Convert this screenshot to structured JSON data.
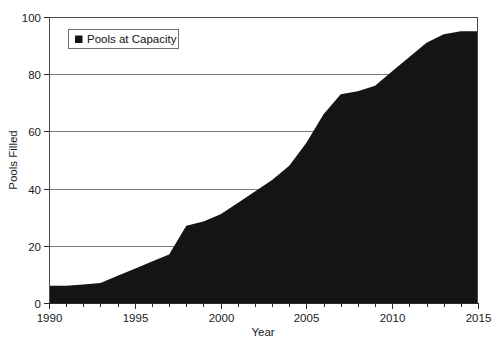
{
  "chart_data": {
    "type": "area",
    "title": "",
    "xlabel": "Year",
    "ylabel": "Pools Filled",
    "xlim": [
      1990,
      2015
    ],
    "ylim": [
      0,
      100
    ],
    "grid": true,
    "grid_axis": "y",
    "legend_position": "top-left",
    "legend": [
      "Pools at Capacity"
    ],
    "series_color": "#141414",
    "xticks": [
      1990,
      1995,
      2000,
      2005,
      2010,
      2015
    ],
    "xtick_labels": [
      "1990",
      "1995",
      "2000",
      "2005",
      "2010",
      "2015"
    ],
    "xminor_step": 1,
    "yticks": [
      0,
      20,
      40,
      60,
      80,
      100
    ],
    "ytick_labels": [
      "0",
      "20",
      "40",
      "60",
      "80",
      "100"
    ],
    "x": [
      1990,
      1991,
      1992,
      1993,
      1994,
      1995,
      1996,
      1997,
      1998,
      1999,
      2000,
      2001,
      2002,
      2003,
      2004,
      2005,
      2006,
      2007,
      2008,
      2009,
      2010,
      2011,
      2012,
      2013,
      2014,
      2015
    ],
    "series": [
      {
        "name": "Pools at Capacity",
        "values": [
          6,
          6,
          6.5,
          7,
          9.5,
          12,
          14.5,
          17,
          27,
          28.5,
          31,
          35,
          39,
          43,
          48,
          56,
          66,
          73,
          74,
          76,
          81,
          86,
          91,
          94,
          95,
          95
        ]
      }
    ]
  },
  "axes": {
    "ylabel": "Pools Filled",
    "xlabel": "Year"
  },
  "legend": {
    "entries": [
      {
        "label": "Pools at Capacity",
        "marker": "filled-square",
        "color": "#141414"
      }
    ]
  }
}
